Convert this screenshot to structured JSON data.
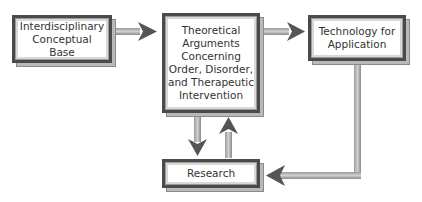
{
  "diagram": {
    "type": "flowchart",
    "nodes": [
      {
        "id": "base",
        "label": "Interdisciplinary Conceptual Base"
      },
      {
        "id": "theory",
        "label": "Theoretical Arguments Concerning Order, Disorder, and Therapeutic Intervention"
      },
      {
        "id": "tech",
        "label": "Technology for Application"
      },
      {
        "id": "research",
        "label": "Research"
      }
    ],
    "edges": [
      {
        "from": "base",
        "to": "theory"
      },
      {
        "from": "theory",
        "to": "tech"
      },
      {
        "from": "theory",
        "to": "research"
      },
      {
        "from": "research",
        "to": "theory"
      },
      {
        "from": "tech",
        "to": "research"
      }
    ],
    "colors": {
      "box_border": "#4a4a4a",
      "shadow": "#b9b9b9",
      "arrow": "#7a7a7a",
      "text": "#333333"
    }
  }
}
